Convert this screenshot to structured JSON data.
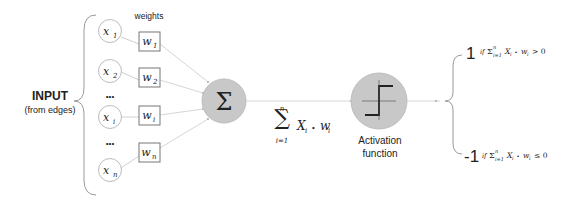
{
  "input_label": {
    "title": "INPUT",
    "subtitle": "(from edges)"
  },
  "weights_header": "weights",
  "inputs": [
    {
      "var": "x",
      "sub": "1",
      "weight_var": "w",
      "weight_sub": "1"
    },
    {
      "var": "x",
      "sub": "2",
      "weight_var": "w",
      "weight_sub": "2"
    },
    {
      "var": "x",
      "sub": "i",
      "weight_var": "w",
      "weight_sub": "i"
    },
    {
      "var": "x",
      "sub": "n",
      "weight_var": "w",
      "weight_sub": "n"
    }
  ],
  "ellipsis": "•••",
  "sum_node": {
    "symbol": "Σ",
    "formula": {
      "sigma": "∑",
      "upper": "n",
      "lower": "i=1",
      "term_var": "X",
      "term_sub": "i",
      "op": "•",
      "weight_var": "w",
      "weight_sub": "i"
    }
  },
  "activation_node": {
    "label_line1": "Activation",
    "label_line2": "function"
  },
  "outputs": [
    {
      "value": "1",
      "condition_prefix": "if",
      "condition_sum": "Σ",
      "condition_upper": "n",
      "condition_lower": "i=1",
      "condition_term": "X",
      "condition_term_sub": "i",
      "condition_op": "•",
      "condition_weight": "w",
      "condition_weight_sub": "i",
      "condition_rel": "> 0"
    },
    {
      "value": "-1",
      "condition_prefix": "if",
      "condition_sum": "Σ",
      "condition_upper": "n",
      "condition_lower": "i=1",
      "condition_term": "X",
      "condition_term_sub": "i",
      "condition_op": "•",
      "condition_weight": "w",
      "condition_weight_sub": "i",
      "condition_rel": "≤ 0"
    }
  ],
  "colors": {
    "node_fill": "#c8c8c8",
    "node_stroke": "#bdbdbd",
    "input_circle_stroke": "#bbbbbb",
    "line": "#cfcfcf",
    "text": "#222222"
  }
}
